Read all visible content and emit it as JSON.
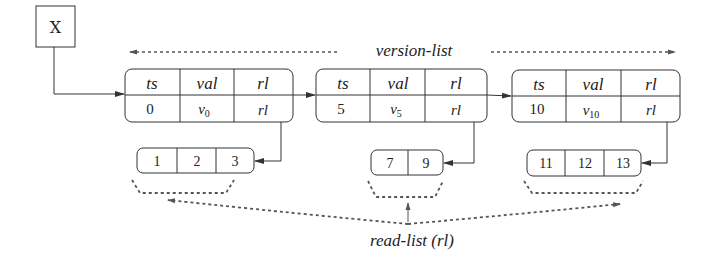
{
  "diagram": {
    "root": {
      "label": "X"
    },
    "version_list_label": "version-list",
    "read_list_label": "read-list (rl)",
    "headers": [
      "ts",
      "val",
      "rl"
    ],
    "versions": [
      {
        "ts": "0",
        "val": "v",
        "val_sub": "0",
        "rl": "rl",
        "read_list": [
          "1",
          "2",
          "3"
        ]
      },
      {
        "ts": "5",
        "val": "v",
        "val_sub": "5",
        "rl": "rl",
        "read_list": [
          "7",
          "9"
        ]
      },
      {
        "ts": "10",
        "val": "v",
        "val_sub": "10",
        "rl": "rl",
        "read_list": [
          "11",
          "12",
          "13"
        ]
      }
    ],
    "colors": {
      "line": "#333333",
      "dotted": "#555555",
      "text": "#222222",
      "background": "#ffffff"
    }
  }
}
